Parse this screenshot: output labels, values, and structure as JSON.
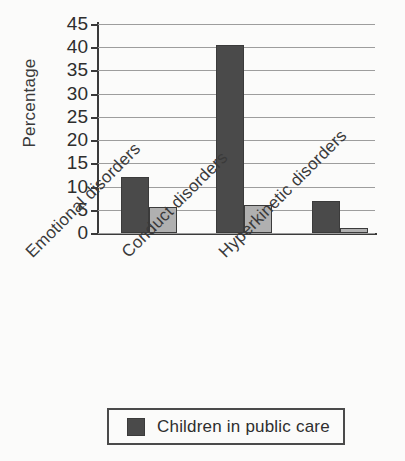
{
  "chart_data": {
    "type": "bar",
    "title": "",
    "xlabel": "",
    "ylabel": "Percentage",
    "ylim": [
      0,
      45
    ],
    "ytick_step": 5,
    "yticks": [
      45,
      40,
      35,
      30,
      25,
      20,
      15,
      10,
      5,
      0
    ],
    "grid": true,
    "grid_axis": "y",
    "legend_position": "bottom",
    "categories": [
      "Emotional disorders",
      "Conduct disorders",
      "Hyperkinetic disorders"
    ],
    "series": [
      {
        "name": "Children in public care",
        "color": "#4a4a4a",
        "values": [
          12,
          40.5,
          7
        ]
      },
      {
        "name": "",
        "color": "#b0b0b0",
        "values": [
          5.5,
          6,
          1
        ]
      }
    ],
    "legend": [
      {
        "label": "Children in public care",
        "color": "#4a4a4a"
      }
    ]
  },
  "colors": {
    "series_dark": "#4a4a4a",
    "series_light": "#b0b0b0",
    "axis": "#3a3a3a",
    "grid": "#9d9d9d",
    "background": "#fbfbfa",
    "text": "#2e2e2e"
  }
}
